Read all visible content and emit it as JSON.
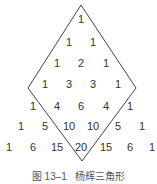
{
  "diagram": {
    "title": "杨辉三角形",
    "rows": [
      [
        "1"
      ],
      [
        "1",
        "1"
      ],
      [
        "1",
        "2",
        "1"
      ],
      [
        "1",
        "3",
        "3",
        "1"
      ],
      [
        "1",
        "4",
        "6",
        "4",
        "1"
      ],
      [
        "1",
        "5",
        "10",
        "10",
        "5",
        "1"
      ],
      [
        "1",
        "6",
        "15",
        "20",
        "15",
        "6",
        "1"
      ]
    ],
    "shape": "diamond",
    "line_color": "#444444"
  },
  "caption": {
    "figure_label": "图 13–1",
    "text": "杨辉三角形"
  }
}
